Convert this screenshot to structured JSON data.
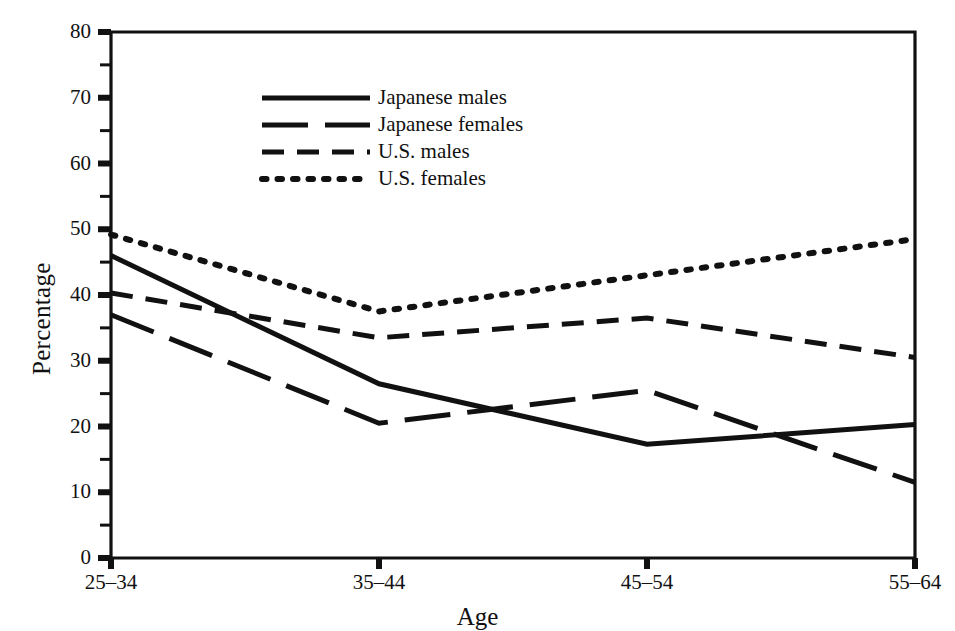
{
  "chart_data": {
    "type": "line",
    "title": "",
    "xlabel": "Age",
    "ylabel": "Percentage",
    "categories": [
      "25–34",
      "35–44",
      "45–54",
      "55–64"
    ],
    "xtick_labels": [
      "25–34",
      "35–44",
      "45–54",
      "55–64"
    ],
    "ytick_labels": [
      "0",
      "10",
      "20",
      "30",
      "40",
      "50",
      "60",
      "70",
      "80"
    ],
    "ytick_values": [
      0,
      10,
      20,
      30,
      40,
      50,
      60,
      70,
      80
    ],
    "ylim": [
      0,
      80
    ],
    "yminor_step": 5,
    "grid": false,
    "legend_position": "upper-center-left",
    "series": [
      {
        "name": "Japanese males",
        "style": "solid",
        "values": [
          46.0,
          26.5,
          17.3,
          20.3
        ],
        "color": "#111111"
      },
      {
        "name": "Japanese females",
        "style": "long-dash",
        "values": [
          37.0,
          20.5,
          25.5,
          11.5
        ],
        "color": "#111111"
      },
      {
        "name": "U.S. males",
        "style": "short-dash",
        "values": [
          40.3,
          33.5,
          36.5,
          30.5
        ],
        "color": "#111111"
      },
      {
        "name": "U.S. females",
        "style": "dotted",
        "values": [
          49.2,
          37.5,
          43.0,
          48.5
        ],
        "color": "#111111"
      }
    ]
  },
  "axes": {
    "y_axis_title": "Percentage",
    "x_axis_title": "Age"
  },
  "legend": {
    "entries": [
      {
        "label": "Japanese males",
        "style": "solid"
      },
      {
        "label": "Japanese females",
        "style": "long-dash"
      },
      {
        "label": "U.S. males",
        "style": "short-dash"
      },
      {
        "label": "U.S. females",
        "style": "dotted"
      }
    ]
  },
  "colors": {
    "ink": "#111111",
    "background": "#ffffff"
  },
  "caption": {
    "clipped_line": ""
  }
}
